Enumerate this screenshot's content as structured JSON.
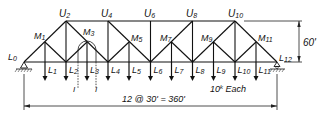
{
  "diagram": {
    "type": "K-truss / subdivided Pratt truss with influence lines",
    "colors": {
      "ink": "#111111",
      "background": "#ffffff"
    },
    "geometry": {
      "bottom_y": 62,
      "top_y": 21,
      "mid_y": 42,
      "left_x": 24,
      "panel_w": 21.08,
      "panels": 12,
      "load_arrow_bottom_y": 80
    },
    "labels": {
      "bottom": [
        "L0",
        "L1",
        "L2",
        "L3",
        "L4",
        "L5",
        "L6",
        "L7",
        "L8",
        "L9",
        "L10",
        "L11",
        "L12"
      ],
      "top": [
        "U2",
        "U4",
        "U6",
        "U8",
        "U10"
      ],
      "mid": [
        "M1",
        "M3",
        "M5",
        "M7",
        "M9",
        "M11"
      ]
    },
    "label_text": {
      "L0": "L",
      "L0_sub": "0",
      "L1": "L",
      "L1_sub": "1",
      "L2": "L",
      "L2_sub": "2",
      "L3": "L",
      "L3_sub": "3",
      "L4": "L",
      "L4_sub": "4",
      "L5": "L",
      "L5_sub": "5",
      "L6": "L",
      "L6_sub": "6",
      "L7": "L",
      "L7_sub": "7",
      "L8": "L",
      "L8_sub": "8",
      "L9": "L",
      "L9_sub": "9",
      "L10": "L",
      "L10_sub": "10",
      "L11": "L",
      "L11_sub": "11",
      "L12": "L",
      "L12_sub": "12",
      "U2": "U",
      "U2_sub": "2",
      "U4": "U",
      "U4_sub": "4",
      "U6": "U",
      "U6_sub": "6",
      "U8": "U",
      "U8_sub": "8",
      "U10": "U",
      "U10_sub": "10",
      "M1": "M",
      "M1_sub": "1",
      "M3": "M",
      "M3_sub": "3",
      "M5": "M",
      "M5_sub": "5",
      "M7": "M",
      "M7_sub": "7",
      "M9": "M",
      "M9_sub": "9",
      "M11": "M",
      "M11_sub": "11"
    },
    "section_marks": {
      "left": "I",
      "right": "I"
    },
    "loads": {
      "label": "10",
      "unit_sup": "k",
      "suffix": " Each"
    },
    "span_dimension": "12 @ 30' = 360'",
    "height_dimension": "60'"
  }
}
